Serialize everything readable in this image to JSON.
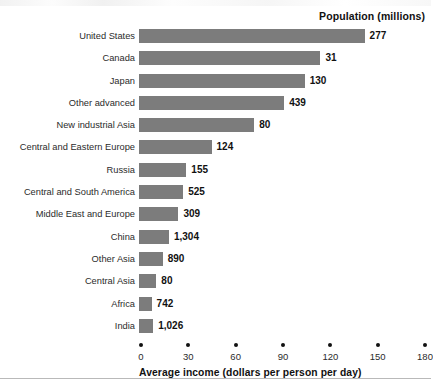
{
  "chart_data": {
    "type": "bar",
    "title": "",
    "series_header": "Population (millions)",
    "orientation": "horizontal",
    "xlabel": "Average income (dollars per person per day)",
    "ylabel": "",
    "xlim": [
      0,
      180
    ],
    "xticks": [
      0,
      30,
      60,
      90,
      120,
      150,
      180
    ],
    "xtick_labels": [
      "0",
      "30",
      "60",
      "90",
      "120",
      "150",
      "180"
    ],
    "grid": false,
    "legend": "none",
    "bar_color": "#7c7c7c",
    "categories": [
      "United States",
      "Canada",
      "Japan",
      "Other advanced",
      "New industrial Asia",
      "Central and Eastern Europe",
      "Russia",
      "Central and South America",
      "Middle East and Europe",
      "China",
      "Other Asia",
      "Central Asia",
      "Africa",
      "India"
    ],
    "values": [
      143,
      115,
      105,
      92,
      73,
      46,
      30,
      28,
      25,
      19,
      15,
      11,
      8,
      9
    ],
    "data_labels": [
      "277",
      "31",
      "130",
      "439",
      "80",
      "124",
      "155",
      "525",
      "309",
      "1,304",
      "890",
      "80",
      "742",
      "1,026"
    ],
    "data_label_meaning": "Population (millions)"
  }
}
